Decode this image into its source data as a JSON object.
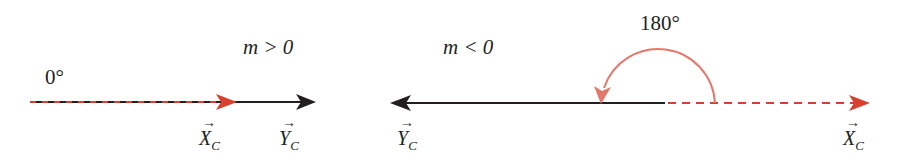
{
  "colors": {
    "black": "#231f20",
    "red": "#d7402f",
    "arc": "#e5776b"
  },
  "left_panel": {
    "condition": "m > 0",
    "angle": "0°",
    "vector_x": {
      "symbol": "X",
      "subscript": "C",
      "arrow": "→"
    },
    "vector_y": {
      "symbol": "Y",
      "subscript": "C",
      "arrow": "→"
    }
  },
  "right_panel": {
    "condition": "m < 0",
    "angle": "180°",
    "vector_y": {
      "symbol": "Y",
      "subscript": "C",
      "arrow": "→"
    },
    "vector_x": {
      "symbol": "X",
      "subscript": "C",
      "arrow": "→"
    }
  }
}
